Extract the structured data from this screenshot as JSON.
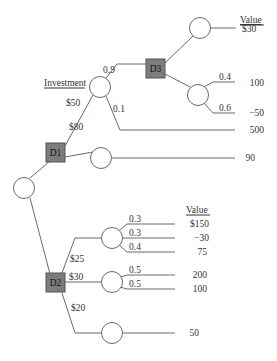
{
  "diagram": {
    "type": "decision-tree",
    "headers": {
      "value_top": "Value",
      "value_bottom": "Value",
      "investment": "Investment"
    },
    "decision_nodes": [
      {
        "id": "D1",
        "label": "D1"
      },
      {
        "id": "D2",
        "label": "D2"
      },
      {
        "id": "D3",
        "label": "D3"
      }
    ],
    "D1": {
      "branches": [
        {
          "label": "$50",
          "chance": {
            "branches": [
              {
                "prob": "0.9",
                "to": "D3"
              },
              {
                "prob": "0.1",
                "value": "500"
              }
            ]
          }
        },
        {
          "label": "$80",
          "chance": {
            "value": "90"
          }
        }
      ]
    },
    "D3": {
      "branches": [
        {
          "chance": {
            "value": "$30"
          }
        },
        {
          "chance": {
            "branches": [
              {
                "prob": "0.4",
                "value": "100"
              },
              {
                "prob": "0.6",
                "value": "−50"
              }
            ]
          }
        }
      ]
    },
    "D2": {
      "branches": [
        {
          "label": "$25",
          "chance": {
            "branches": [
              {
                "prob": "0.3",
                "value": "$150"
              },
              {
                "prob": "0.3",
                "value": "−30"
              },
              {
                "prob": "0.4",
                "value": "75"
              }
            ]
          }
        },
        {
          "label": "$30",
          "chance": {
            "branches": [
              {
                "prob": "0.5",
                "value": "200"
              },
              {
                "prob": "0.5",
                "value": "100"
              }
            ]
          }
        },
        {
          "label": "$20",
          "chance": {
            "value": "50"
          }
        }
      ]
    },
    "colors": {
      "decision_fill": "#7d7d7d",
      "line": "#6a6a6a",
      "chance_fill": "#ffffff"
    }
  }
}
